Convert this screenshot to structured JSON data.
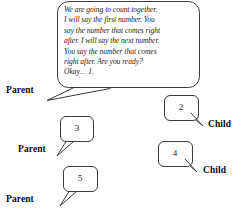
{
  "figure": {
    "type": "speech-bubble-dialogue-diagram",
    "background_color": "#ffffff",
    "stroke_color": "#3a3a3a"
  },
  "bubbles": [
    {
      "id": "parent-instruction",
      "speaker": "Parent",
      "text": "We are going to count together.\nI will say the first number. You\nsay the number that comes right\nafter. I will say the next number.\nYou say the number that comes\nright after. Are you ready?\nOkay… 1."
    },
    {
      "id": "child-2",
      "speaker": "Child",
      "text": "2"
    },
    {
      "id": "parent-3",
      "speaker": "Parent",
      "text": "3"
    },
    {
      "id": "child-4",
      "speaker": "Child",
      "text": "4"
    },
    {
      "id": "parent-5",
      "speaker": "Parent",
      "text": "5"
    }
  ],
  "labels": {
    "parent_1": "Parent",
    "child_1": "Child",
    "parent_2": "Parent",
    "child_2": "Child",
    "parent_3": "Parent"
  }
}
